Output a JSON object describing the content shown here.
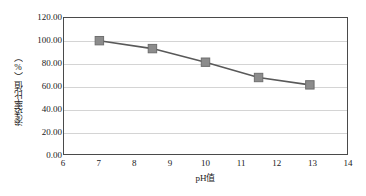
{
  "chart_data": {
    "type": "line",
    "title": "",
    "subtitle": "",
    "xlabel": "pH值",
    "ylabel": "渗透率比值（%）",
    "xlim": [
      6,
      14
    ],
    "ylim": [
      0,
      120
    ],
    "x_ticks": [
      "6",
      "7",
      "8",
      "9",
      "10",
      "11",
      "12",
      "13",
      "14"
    ],
    "x_tick_values": [
      6,
      7,
      8,
      9,
      10,
      11,
      12,
      13,
      14
    ],
    "y_ticks": [
      "0.00",
      "20.00",
      "40.00",
      "60.00",
      "80.00",
      "100.00",
      "120.00"
    ],
    "y_tick_values": [
      0,
      20,
      40,
      60,
      80,
      100,
      120
    ],
    "grid": "horizontal",
    "legend": "none",
    "series": [
      {
        "name": "渗透率比值",
        "marker": "square",
        "marker_color": "#8c8c8c",
        "marker_edge_color": "#6e6e6e",
        "line_color": "#595959",
        "points": [
          {
            "x": 7.0,
            "y": 100.0
          },
          {
            "x": 8.5,
            "y": 93.0
          },
          {
            "x": 10.0,
            "y": 81.0
          },
          {
            "x": 11.5,
            "y": 67.5
          },
          {
            "x": 12.95,
            "y": 61.0
          }
        ]
      }
    ],
    "colors": {
      "axis": "#4a4a4a",
      "gridline": "#d4d4d4",
      "text": "#1a1a1a",
      "background": "#ffffff"
    }
  }
}
